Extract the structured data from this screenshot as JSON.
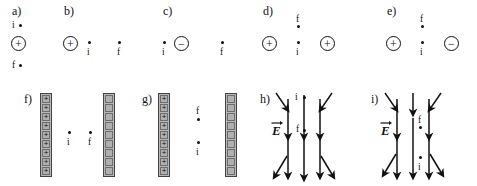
{
  "figure": {
    "type": "physics-diagram",
    "colors": {
      "ink": "#111111",
      "plate_fill": "#b0b0b0",
      "plate_border": "#6d6d6d",
      "background": "#ffffff"
    }
  },
  "panels": [
    {
      "id": "a",
      "label": "a)",
      "kind": "single-charge-vertical",
      "charges": [
        {
          "sign": "+",
          "glyph": "+"
        }
      ],
      "points": [
        {
          "name": "i",
          "label": "i",
          "position": "above",
          "label_side": "left"
        },
        {
          "name": "f",
          "label": "f",
          "position": "below",
          "label_side": "left"
        }
      ]
    },
    {
      "id": "b",
      "label": "b)",
      "kind": "single-charge-horizontal",
      "charges": [
        {
          "sign": "+",
          "glyph": "+"
        }
      ],
      "points": [
        {
          "name": "i",
          "label": "i",
          "position": "right-near",
          "label_side": "below"
        },
        {
          "name": "f",
          "label": "f",
          "position": "right-far",
          "label_side": "below"
        }
      ]
    },
    {
      "id": "c",
      "label": "c)",
      "kind": "single-charge-horizontal",
      "charges": [
        {
          "sign": "−",
          "glyph": "−"
        }
      ],
      "points": [
        {
          "name": "i",
          "label": "i",
          "position": "left-near",
          "label_side": "below"
        },
        {
          "name": "f",
          "label": "f",
          "position": "right-far",
          "label_side": "below"
        }
      ]
    },
    {
      "id": "d",
      "label": "d)",
      "kind": "two-charge-pair",
      "charges": [
        {
          "sign": "+",
          "glyph": "+",
          "position": "left"
        },
        {
          "sign": "+",
          "glyph": "+",
          "position": "right"
        }
      ],
      "points": [
        {
          "name": "f",
          "label": "f",
          "position": "above-center",
          "label_side": "above"
        },
        {
          "name": "i",
          "label": "i",
          "position": "center",
          "label_side": "below"
        }
      ]
    },
    {
      "id": "e",
      "label": "e)",
      "kind": "two-charge-pair",
      "charges": [
        {
          "sign": "+",
          "glyph": "+",
          "position": "left"
        },
        {
          "sign": "−",
          "glyph": "−",
          "position": "right"
        }
      ],
      "points": [
        {
          "name": "f",
          "label": "f",
          "position": "above-center",
          "label_side": "above"
        },
        {
          "name": "i",
          "label": "i",
          "position": "center",
          "label_side": "below"
        }
      ]
    },
    {
      "id": "f",
      "label": "f)",
      "kind": "parallel-plates",
      "plates": [
        {
          "side": "left",
          "marking": "+",
          "cells": 9
        },
        {
          "side": "right",
          "marking": "",
          "cells": 9
        }
      ],
      "points": [
        {
          "name": "i",
          "label": "i",
          "position": "left-of-center",
          "label_side": "below"
        },
        {
          "name": "f",
          "label": "f",
          "position": "right-of-center",
          "label_side": "below"
        }
      ]
    },
    {
      "id": "g",
      "label": "g)",
      "kind": "parallel-plates",
      "plates": [
        {
          "side": "left",
          "marking": "+",
          "cells": 9
        },
        {
          "side": "right",
          "marking": "",
          "cells": 9
        }
      ],
      "points": [
        {
          "name": "f",
          "label": "f",
          "position": "upper-middle",
          "label_side": "above"
        },
        {
          "name": "i",
          "label": "i",
          "position": "lower-middle",
          "label_side": "below"
        }
      ]
    },
    {
      "id": "h",
      "label": "h)",
      "kind": "field-lines",
      "field_label": "E",
      "field_direction": "downward",
      "line_count": 3,
      "splay_arrows": 4,
      "points": [
        {
          "name": "i",
          "label": "i",
          "position": "top-center",
          "label_side": "left"
        },
        {
          "name": "f",
          "label": "f",
          "position": "middle-center",
          "label_side": "left"
        }
      ]
    },
    {
      "id": "i",
      "label": "i)",
      "kind": "field-lines",
      "field_label": "E",
      "field_direction": "downward",
      "line_count": 3,
      "splay_arrows": 4,
      "points": [
        {
          "name": "f",
          "label": "f",
          "position": "upper-center",
          "label_side": "above"
        },
        {
          "name": "i",
          "label": "i",
          "position": "lower-center",
          "label_side": "below"
        }
      ]
    }
  ]
}
